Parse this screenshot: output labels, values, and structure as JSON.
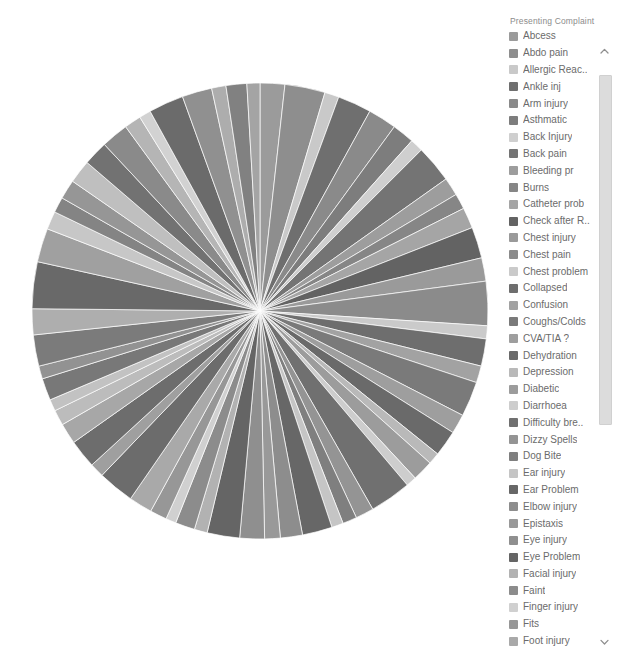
{
  "legend": {
    "title": "Presenting Complaint",
    "scroll_up_icon": "chevron-up-icon",
    "scroll_down_icon": "chevron-down-icon",
    "items": [
      {
        "label": "Abcess",
        "color": "#9b9b9b"
      },
      {
        "label": "Abdo pain",
        "color": "#8e8e8e"
      },
      {
        "label": "Allergic Reac..",
        "color": "#c9c9c9"
      },
      {
        "label": "Ankle inj",
        "color": "#6f6f6f"
      },
      {
        "label": "Arm injury",
        "color": "#8a8a8a"
      },
      {
        "label": "Asthmatic",
        "color": "#7d7d7d"
      },
      {
        "label": "Back Injury",
        "color": "#cfcfcf"
      },
      {
        "label": "Back pain",
        "color": "#747474"
      },
      {
        "label": "Bleeding pr",
        "color": "#9d9d9d"
      },
      {
        "label": "Burns",
        "color": "#868686"
      },
      {
        "label": "Catheter prob",
        "color": "#a5a5a5"
      },
      {
        "label": "Check after R..",
        "color": "#636363"
      },
      {
        "label": "Chest injury",
        "color": "#9a9a9a"
      },
      {
        "label": "Chest pain",
        "color": "#8b8b8b"
      },
      {
        "label": "Chest problem",
        "color": "#cacaca"
      },
      {
        "label": "Collapsed",
        "color": "#6e6e6e"
      },
      {
        "label": "Confusion",
        "color": "#a2a2a2"
      },
      {
        "label": "Coughs/Colds",
        "color": "#7a7a7a"
      },
      {
        "label": "CVA/TIA ?",
        "color": "#9e9e9e"
      },
      {
        "label": "Dehydration",
        "color": "#6a6a6a"
      },
      {
        "label": "Depression",
        "color": "#b9b9b9"
      },
      {
        "label": "Diabetic",
        "color": "#9c9c9c"
      },
      {
        "label": "Diarrhoea",
        "color": "#cdcdcd"
      },
      {
        "label": "Difficulty bre..",
        "color": "#707070"
      },
      {
        "label": "Dizzy Spells",
        "color": "#949494"
      },
      {
        "label": "Dog Bite",
        "color": "#7f7f7f"
      },
      {
        "label": "Ear injury",
        "color": "#c5c5c5"
      },
      {
        "label": "Ear Problem",
        "color": "#676767"
      },
      {
        "label": "Elbow injury",
        "color": "#8d8d8d"
      },
      {
        "label": "Epistaxis",
        "color": "#999999"
      },
      {
        "label": "Eye injury",
        "color": "#8f8f8f"
      },
      {
        "label": "Eye Problem",
        "color": "#656565"
      },
      {
        "label": "Facial injury",
        "color": "#b2b2b2"
      },
      {
        "label": "Faint",
        "color": "#8c8c8c"
      },
      {
        "label": "Finger injury",
        "color": "#d0d0d0"
      },
      {
        "label": "Fits",
        "color": "#979797"
      },
      {
        "label": "Foot injury",
        "color": "#a9a9a9"
      },
      {
        "label": "Generally un..",
        "color": "#6c6c6c"
      },
      {
        "label": "GI bleed",
        "color": "#9f9f9f"
      },
      {
        "label": "Groin pain",
        "color": "#6d6d6d"
      },
      {
        "label": "Hand injury",
        "color": "#a7a7a7"
      },
      {
        "label": "Head injury",
        "color": "#bcbcbc"
      },
      {
        "label": "High Temper..",
        "color": "#c2c2c2"
      },
      {
        "label": "Hip inj",
        "color": "#787878"
      },
      {
        "label": "Insect bite",
        "color": "#929292"
      },
      {
        "label": "",
        "color": "#8a8a8a"
      }
    ]
  },
  "chart_data": {
    "type": "pie",
    "title": "",
    "legend_title": "Presenting Complaint",
    "legend_position": "right",
    "grid": false,
    "center": [
      260,
      311
    ],
    "radius": 231,
    "start_angle": -90,
    "note": "Grayscale pie of emergency department presenting complaints; many thin slices of similar magnitude.",
    "categories": [
      "Abcess",
      "Abdo pain",
      "Allergic Reac..",
      "Ankle inj",
      "Arm injury",
      "Asthmatic",
      "Back Injury",
      "Back pain",
      "Bleeding pr",
      "Burns",
      "Catheter prob",
      "Check after R..",
      "Chest injury",
      "Chest pain",
      "Chest problem",
      "Collapsed",
      "Confusion",
      "Coughs/Colds",
      "CVA/TIA ?",
      "Dehydration",
      "Depression",
      "Diabetic",
      "Diarrhoea",
      "Difficulty bre..",
      "Dizzy Spells",
      "Dog Bite",
      "Ear injury",
      "Ear Problem",
      "Elbow injury",
      "Epistaxis",
      "Eye injury",
      "Eye Problem",
      "Facial injury",
      "Faint",
      "Finger injury",
      "Fits",
      "Foot injury",
      "Generally un..",
      "GI bleed",
      "Groin pain",
      "Hand injury",
      "Head injury",
      "High Temper..",
      "Hip inj",
      "Insect bite",
      "Intoxicated ?",
      "Knee injury",
      "Laceration",
      "Leg injury",
      "Limb pain",
      "Neck injury",
      "Overdose",
      "Rash",
      "Shoulder inj",
      "Soft tissue inj",
      "Sore throat",
      "Toe injury",
      "Unwell",
      "Vomiting",
      "Wound check",
      "Wrist injury",
      "Other"
    ],
    "values": [
      1.9,
      3.1,
      1.1,
      2.6,
      2.2,
      1.7,
      1.0,
      2.9,
      1.4,
      1.2,
      1.6,
      2.4,
      1.8,
      3.4,
      1.0,
      2.1,
      1.3,
      2.7,
      1.5,
      2.0,
      0.9,
      1.6,
      0.8,
      3.2,
      1.4,
      1.1,
      0.9,
      2.3,
      1.7,
      1.2,
      1.9,
      2.5,
      1.0,
      1.5,
      0.8,
      1.3,
      1.8,
      2.8,
      1.1,
      2.2,
      1.6,
      1.2,
      0.9,
      1.7,
      1.0,
      2.4,
      2.0,
      3.6,
      2.6,
      1.4,
      1.2,
      1.5,
      1.8,
      1.9,
      2.1,
      1.3,
      0.9,
      2.7,
      2.3,
      1.1,
      1.6,
      1.0
    ],
    "slice_colors": [
      "#9b9b9b",
      "#8e8e8e",
      "#c9c9c9",
      "#6f6f6f",
      "#8a8a8a",
      "#7d7d7d",
      "#cfcfcf",
      "#747474",
      "#9d9d9d",
      "#868686",
      "#a5a5a5",
      "#636363",
      "#9a9a9a",
      "#8b8b8b",
      "#cacaca",
      "#6e6e6e",
      "#a2a2a2",
      "#7a7a7a",
      "#9e9e9e",
      "#6a6a6a",
      "#b9b9b9",
      "#9c9c9c",
      "#cdcdcd",
      "#707070",
      "#949494",
      "#7f7f7f",
      "#c5c5c5",
      "#676767",
      "#8d8d8d",
      "#999999",
      "#8f8f8f",
      "#656565",
      "#b2b2b2",
      "#8c8c8c",
      "#d0d0d0",
      "#979797",
      "#a9a9a9",
      "#6c6c6c",
      "#9f9f9f",
      "#6d6d6d",
      "#a7a7a7",
      "#bcbcbc",
      "#c2c2c2",
      "#787878",
      "#929292",
      "#7b7b7b",
      "#aeaeae",
      "#696969",
      "#a0a0a0",
      "#c7c7c7",
      "#848484",
      "#969696",
      "#bfbfbf",
      "#727272",
      "#8a8a8a",
      "#b5b5b5",
      "#d2d2d2",
      "#6b6b6b",
      "#909090",
      "#adadad",
      "#818181",
      "#a4a4a4"
    ]
  }
}
